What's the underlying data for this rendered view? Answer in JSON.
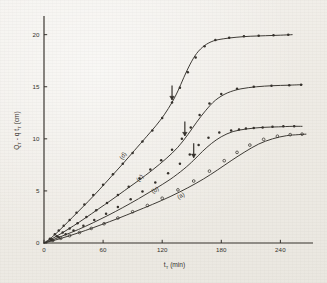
{
  "figure": {
    "kind": "scientific-plot",
    "background_color": "#efece6",
    "ink_color": "#34302b"
  },
  "axes": {
    "x": {
      "title_main": "t",
      "title_sub": "T",
      "title_unit": "(min)",
      "ticks": [
        "0",
        "60",
        "120",
        "180",
        "240"
      ],
      "tick_values": [
        0,
        60,
        120,
        180,
        240
      ],
      "range": [
        0,
        265
      ]
    },
    "y": {
      "title_main": "Q",
      "title_sub1": "T",
      "title_mid": " - q t",
      "title_sub2": "T",
      "title_unit": "(cm)",
      "ticks": [
        "0",
        "5",
        "10",
        "15",
        "20"
      ],
      "tick_values": [
        0,
        5,
        10,
        15,
        20
      ],
      "range": [
        0,
        21.6
      ]
    }
  },
  "curve_labels": [
    {
      "id": "a",
      "text": "(a)"
    },
    {
      "id": "b",
      "text": "(b)"
    },
    {
      "id": "c",
      "text": "(c)"
    },
    {
      "id": "d",
      "text": "(d)"
    }
  ],
  "annotations": {
    "arrows": [
      {
        "curve": "d",
        "t": 130,
        "note": "breakthrough marker"
      },
      {
        "curve": "c",
        "t": 143,
        "note": "breakthrough marker"
      },
      {
        "curve": "b",
        "t": 152,
        "note": "breakthrough marker"
      }
    ]
  },
  "chart_data": {
    "type": "line",
    "title": "",
    "xlabel": "t_T (min)",
    "ylabel": "Q_T - q t_T (cm)",
    "xlim": [
      0,
      265
    ],
    "ylim": [
      0,
      21.6
    ],
    "grid": false,
    "legend": "inline-curve-labels",
    "xticks": [
      0,
      60,
      120,
      180,
      240
    ],
    "yticks": [
      0,
      5,
      10,
      15,
      20
    ],
    "series": [
      {
        "name": "(d)",
        "marker": "filled-circle",
        "line_x": [
          0,
          8,
          16,
          24,
          34,
          45,
          56,
          68,
          80,
          92,
          104,
          114,
          122,
          130,
          136,
          142,
          148,
          155,
          163,
          172,
          182,
          195,
          210,
          225,
          240,
          252
        ],
        "line_y": [
          0,
          0.55,
          1.25,
          2.0,
          2.95,
          4.0,
          5.1,
          6.35,
          7.6,
          8.9,
          10.2,
          11.3,
          12.3,
          13.5,
          14.6,
          15.9,
          17.1,
          18.2,
          18.95,
          19.4,
          19.6,
          19.75,
          19.85,
          19.9,
          19.95,
          20.0
        ],
        "points_x": [
          6,
          11,
          15,
          20,
          26,
          33,
          41,
          50,
          60,
          70,
          80,
          90,
          100,
          110,
          120,
          130,
          138,
          146,
          154,
          163,
          174,
          188,
          203,
          218,
          233,
          248
        ],
        "points_y": [
          0.4,
          0.85,
          1.2,
          1.65,
          2.2,
          2.9,
          3.7,
          4.6,
          5.6,
          6.6,
          7.6,
          8.65,
          9.75,
          10.8,
          12.0,
          13.5,
          14.9,
          16.4,
          17.8,
          18.9,
          19.5,
          19.7,
          19.85,
          19.9,
          19.95,
          20.0
        ]
      },
      {
        "name": "(c)",
        "marker": "filled-circle",
        "line_x": [
          0,
          9,
          19,
          30,
          42,
          55,
          68,
          82,
          96,
          110,
          124,
          136,
          146,
          155,
          164,
          174,
          186,
          200,
          216,
          232,
          248,
          262
        ],
        "line_y": [
          0,
          0.45,
          1.0,
          1.65,
          2.4,
          3.25,
          4.1,
          5.05,
          6.0,
          7.0,
          8.1,
          9.2,
          10.4,
          11.6,
          12.7,
          13.7,
          14.4,
          14.8,
          15.0,
          15.1,
          15.15,
          15.2
        ],
        "points_x": [
          7,
          13,
          19,
          26,
          34,
          43,
          53,
          64,
          75,
          86,
          97,
          108,
          119,
          130,
          140,
          149,
          158,
          168,
          180,
          196,
          213,
          231,
          249,
          261
        ],
        "points_y": [
          0.35,
          0.65,
          1.0,
          1.4,
          1.9,
          2.5,
          3.15,
          3.85,
          4.6,
          5.4,
          6.2,
          7.05,
          7.95,
          8.95,
          10.0,
          11.1,
          12.3,
          13.4,
          14.3,
          14.8,
          15.0,
          15.1,
          15.15,
          15.2
        ]
      },
      {
        "name": "(b)",
        "marker": "filled-circle",
        "line_x": [
          0,
          10,
          22,
          35,
          50,
          65,
          80,
          96,
          112,
          128,
          142,
          152,
          161,
          170,
          180,
          192,
          206,
          222,
          238,
          252,
          262
        ],
        "line_y": [
          0,
          0.35,
          0.8,
          1.3,
          1.95,
          2.65,
          3.4,
          4.25,
          5.15,
          6.1,
          7.1,
          7.95,
          8.8,
          9.55,
          10.2,
          10.7,
          10.95,
          11.1,
          11.15,
          11.2,
          11.2
        ],
        "points_x": [
          8,
          15,
          22,
          30,
          40,
          51,
          63,
          75,
          88,
          100,
          113,
          126,
          138,
          148,
          157,
          167,
          178,
          190,
          198,
          205,
          213,
          222,
          232,
          243,
          254
        ],
        "points_y": [
          0.3,
          0.55,
          0.85,
          1.2,
          1.65,
          2.2,
          2.8,
          3.45,
          4.2,
          4.95,
          5.8,
          6.7,
          7.6,
          8.5,
          9.4,
          10.1,
          10.6,
          10.8,
          10.9,
          11.0,
          11.05,
          11.1,
          11.15,
          11.2,
          11.2
        ]
      },
      {
        "name": "(a)",
        "marker": "open-circle",
        "line_x": [
          0,
          12,
          26,
          42,
          58,
          75,
          92,
          110,
          128,
          146,
          162,
          176,
          190,
          204,
          218,
          232,
          246,
          258,
          266
        ],
        "line_y": [
          0,
          0.3,
          0.7,
          1.2,
          1.75,
          2.35,
          3.0,
          3.7,
          4.45,
          5.3,
          6.15,
          7.0,
          7.9,
          8.75,
          9.5,
          10.0,
          10.3,
          10.4,
          10.45
        ],
        "points_x": [
          9,
          17,
          26,
          36,
          48,
          61,
          75,
          90,
          105,
          120,
          136,
          152,
          168,
          183,
          196,
          209,
          223,
          237,
          250,
          262
        ],
        "points_y": [
          0.25,
          0.45,
          0.7,
          1.0,
          1.4,
          1.85,
          2.4,
          3.0,
          3.6,
          4.3,
          5.1,
          5.95,
          6.9,
          7.9,
          8.7,
          9.4,
          9.95,
          10.25,
          10.4,
          10.45
        ]
      }
    ]
  }
}
